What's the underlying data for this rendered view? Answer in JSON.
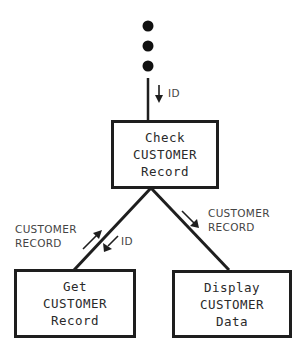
{
  "diagram": {
    "continuation": "...",
    "top_flow": {
      "label": "ID",
      "direction": "down"
    },
    "nodes": {
      "check": {
        "lines": [
          "Check",
          "CUSTOMER",
          "Record"
        ]
      },
      "get": {
        "lines": [
          "Get",
          "CUSTOMER",
          "Record"
        ]
      },
      "display": {
        "lines": [
          "Display",
          "CUSTOMER",
          "Data"
        ]
      }
    },
    "left_flows": {
      "up_label": [
        "CUSTOMER",
        "RECORD"
      ],
      "down_label": "ID"
    },
    "right_flow": {
      "label": [
        "CUSTOMER",
        "RECORD"
      ]
    },
    "colors": {
      "line": "#1e1e1e",
      "text": "#444444"
    }
  }
}
